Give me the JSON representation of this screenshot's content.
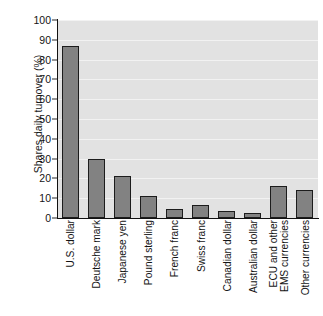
{
  "chart_data": {
    "type": "bar",
    "title": "",
    "xlabel": "",
    "ylabel": "Shares daily turnover (%)",
    "ylim": [
      0,
      100
    ],
    "ytick_values": [
      0,
      10,
      20,
      30,
      40,
      50,
      60,
      70,
      80,
      90,
      100
    ],
    "ytick_labels": [
      "0",
      "10",
      "20",
      "30",
      "40",
      "50",
      "60",
      "70",
      "80",
      "90",
      "100"
    ],
    "grid": "horizontal",
    "legend": "none",
    "orientation": "vertical",
    "categories": [
      "U.S. dollar",
      "Deutsche mark",
      "Japanese yen",
      "Pound sterling",
      "French franc",
      "Swiss franc",
      "Canadian dollar",
      "Australian dollar",
      "ECU and other\nEMS currencies",
      "Other currencies"
    ],
    "category_lines": [
      [
        "U.S. dollar"
      ],
      [
        "Deutsche mark"
      ],
      [
        "Japanese yen"
      ],
      [
        "Pound sterling"
      ],
      [
        "French franc"
      ],
      [
        "Swiss franc"
      ],
      [
        "Canadian dollar"
      ],
      [
        "Australian dollar"
      ],
      [
        "ECU and other",
        "EMS currencies"
      ],
      [
        "Other currencies"
      ]
    ],
    "values": [
      87,
      30,
      21,
      11,
      4.5,
      6.5,
      3.5,
      2.5,
      16,
      14
    ],
    "colors": {
      "bar_fill": "#828282",
      "bar_edge": "#1c1c1c",
      "plot_background": "#e2e2e2",
      "gridline": "#f2f2f2",
      "axis": "#111111",
      "text": "#141414",
      "figure_background": "#ffffff"
    }
  }
}
